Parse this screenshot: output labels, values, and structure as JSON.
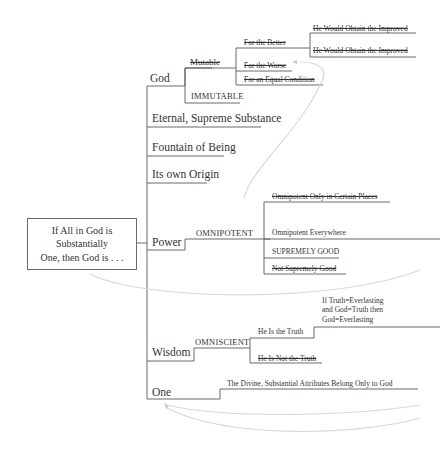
{
  "diagram": {
    "root": {
      "label_line1": "If All in God is Substantially",
      "label_line2": "One, then God is . . ."
    },
    "branches": {
      "god": {
        "label": "God",
        "mutable": {
          "label": "Mutable",
          "struck": true,
          "children": {
            "better": {
              "label": "For the Better",
              "struck": true
            },
            "worse": {
              "label": "For the Worse",
              "struck": true
            },
            "equal": {
              "label": "For an Equal Condition",
              "struck": true
            }
          },
          "better_children": {
            "improved_1": {
              "label": "He Would Obtain the Improved",
              "struck": true
            },
            "improved_2": {
              "label": "He Would Obtain the Improved",
              "struck": true
            }
          }
        },
        "immutable": {
          "label": "IMMUTABLE"
        }
      },
      "eternal": {
        "label": "Eternal, Supreme Substance"
      },
      "fountain": {
        "label": "Fountain of Being"
      },
      "origin": {
        "label": "Its own Origin"
      },
      "power": {
        "label": "Power",
        "omnipotent": {
          "label": "OMNIPOTENT",
          "children": {
            "certain_places": {
              "label": "Omnipotent Only in Certain Places",
              "struck": true
            },
            "everywhere": {
              "label": "Omnipotent Everywhere"
            },
            "supremely_good": {
              "label": "SUPREMELY GOOD"
            },
            "not_supremely_good": {
              "label": "Not Supremely Good",
              "struck": true
            }
          }
        }
      },
      "wisdom": {
        "label": "Wisdom",
        "omniscient": {
          "label": "OMNISCIENT",
          "children": {
            "is_truth": {
              "label": "He Is the Truth"
            },
            "not_truth": {
              "label": "He Is Not the Truth",
              "struck": true
            }
          },
          "syllogism": {
            "line1": "If Truth=Everlasting",
            "line2": "and God=Truth then",
            "line3": "God=Everlasting"
          }
        }
      },
      "one": {
        "label": "One",
        "conclusion": {
          "label": "The Divine, Substantial Attributes Belong Only to God"
        }
      }
    },
    "colors": {
      "line": "#555555",
      "text": "#333333",
      "arrow": "#d8d8d8"
    }
  }
}
